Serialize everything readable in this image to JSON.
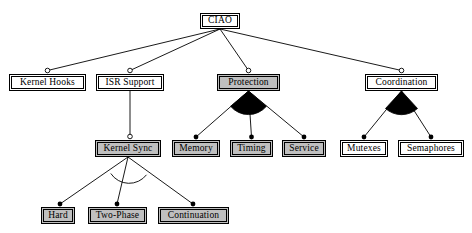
{
  "diagram": {
    "background_color": "#ffffff",
    "line_color": "#000000",
    "shaded_fill": "#bfbfbf",
    "plain_fill": "#ffffff",
    "nodes": [
      {
        "id": "ciao",
        "label": "CIAO",
        "x": 200,
        "y": 13,
        "w": 40,
        "h": 16,
        "fill": "plain",
        "level": 0
      },
      {
        "id": "kernel_hooks",
        "label": "Kernel Hooks",
        "x": 9,
        "y": 74,
        "w": 77,
        "h": 17,
        "fill": "plain",
        "level": 1
      },
      {
        "id": "isr_support",
        "label": "ISR Support",
        "x": 96,
        "y": 74,
        "w": 68,
        "h": 17,
        "fill": "plain",
        "level": 1
      },
      {
        "id": "protection",
        "label": "Protection",
        "x": 217,
        "y": 74,
        "w": 63,
        "h": 17,
        "fill": "shaded",
        "level": 1
      },
      {
        "id": "coordination",
        "label": "Coordination",
        "x": 365,
        "y": 74,
        "w": 73,
        "h": 17,
        "fill": "plain",
        "level": 1
      },
      {
        "id": "kernel_sync",
        "label": "Kernel Sync",
        "x": 95,
        "y": 140,
        "w": 66,
        "h": 17,
        "fill": "shaded",
        "level": 2
      },
      {
        "id": "memory",
        "label": "Memory",
        "x": 172,
        "y": 140,
        "w": 48,
        "h": 17,
        "fill": "shaded",
        "level": 2
      },
      {
        "id": "timing",
        "label": "Timing",
        "x": 230,
        "y": 140,
        "w": 43,
        "h": 17,
        "fill": "shaded",
        "level": 2
      },
      {
        "id": "service",
        "label": "Service",
        "x": 282,
        "y": 140,
        "w": 44,
        "h": 17,
        "fill": "shaded",
        "level": 2
      },
      {
        "id": "mutexes",
        "label": "Mutexes",
        "x": 340,
        "y": 140,
        "w": 48,
        "h": 17,
        "fill": "plain",
        "level": 2
      },
      {
        "id": "semaphores",
        "label": "Semaphores",
        "x": 398,
        "y": 140,
        "w": 66,
        "h": 17,
        "fill": "plain",
        "level": 2
      },
      {
        "id": "hard",
        "label": "Hard",
        "x": 41,
        "y": 207,
        "w": 34,
        "h": 17,
        "fill": "shaded",
        "level": 3
      },
      {
        "id": "two_phase",
        "label": "Two-Phase",
        "x": 88,
        "y": 207,
        "w": 59,
        "h": 17,
        "fill": "shaded",
        "level": 3
      },
      {
        "id": "continuation",
        "label": "Continuation",
        "x": 158,
        "y": 207,
        "w": 71,
        "h": 17,
        "fill": "shaded",
        "level": 3
      }
    ],
    "edges": [
      {
        "from": "ciao",
        "to": "kernel_hooks",
        "endpoint": "hollow-circle"
      },
      {
        "from": "ciao",
        "to": "isr_support",
        "endpoint": "hollow-circle"
      },
      {
        "from": "ciao",
        "to": "protection",
        "endpoint": "hollow-circle"
      },
      {
        "from": "ciao",
        "to": "coordination",
        "endpoint": "hollow-circle"
      },
      {
        "from": "isr_support",
        "to": "kernel_sync",
        "endpoint": "hollow-circle"
      },
      {
        "from": "protection",
        "to": "memory",
        "endpoint": "filled-dot"
      },
      {
        "from": "protection",
        "to": "timing",
        "endpoint": "filled-dot"
      },
      {
        "from": "protection",
        "to": "service",
        "endpoint": "filled-dot"
      },
      {
        "from": "coordination",
        "to": "mutexes",
        "endpoint": "filled-dot"
      },
      {
        "from": "coordination",
        "to": "semaphores",
        "endpoint": "filled-dot"
      },
      {
        "from": "kernel_sync",
        "to": "hard",
        "endpoint": "filled-dot"
      },
      {
        "from": "kernel_sync",
        "to": "two_phase",
        "endpoint": "filled-dot"
      },
      {
        "from": "kernel_sync",
        "to": "continuation",
        "endpoint": "filled-dot"
      }
    ],
    "group_markers": [
      {
        "at": "protection",
        "style": "filled-arc",
        "meaning": "alternative-group"
      },
      {
        "at": "coordination",
        "style": "filled-arc",
        "meaning": "alternative-group"
      },
      {
        "at": "kernel_sync",
        "style": "open-arc",
        "meaning": "or-group"
      }
    ]
  }
}
